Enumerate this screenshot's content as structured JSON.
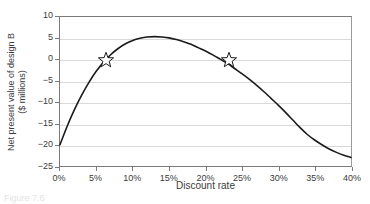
{
  "figure": {
    "caption_partial": "Figure 7.6"
  },
  "chart_data": {
    "type": "line",
    "title": "",
    "subtitle": "",
    "xlabel": "Discount rate",
    "ylabel": "Net present value of design B ($ millions)",
    "ylabel_line1": "Net present value of design B",
    "ylabel_line2": "($ millions)",
    "xlim": [
      0,
      40
    ],
    "ylim": [
      -25,
      10
    ],
    "xtick_labels": [
      "0%",
      "5%",
      "10%",
      "15%",
      "20%",
      "25%",
      "30%",
      "35%",
      "40%"
    ],
    "xtick_values": [
      0,
      5,
      10,
      15,
      20,
      25,
      30,
      35,
      40
    ],
    "ytick_labels": [
      "10",
      "5",
      "0",
      "-5",
      "-10",
      "-15",
      "-20",
      "-25"
    ],
    "ytick_values": [
      10,
      5,
      0,
      -5,
      -10,
      -15,
      -20,
      -25
    ],
    "grid": "horizontal",
    "legend": "none",
    "series": [
      {
        "name": "Net present value of design B",
        "color": "#1a1a1a",
        "x": [
          0,
          1,
          2,
          3,
          4,
          5,
          6,
          7,
          8,
          9,
          10,
          11,
          12,
          13,
          14,
          15,
          16,
          17,
          18,
          19,
          20,
          21,
          22,
          23,
          24,
          25,
          26,
          27,
          28,
          29,
          30,
          31,
          32,
          33,
          34,
          35,
          36,
          37,
          38,
          39,
          40
        ],
        "y": [
          -20.0,
          -15.6,
          -11.7,
          -8.3,
          -5.3,
          -2.7,
          -0.6,
          1.2,
          2.6,
          3.7,
          4.5,
          5.0,
          5.3,
          5.4,
          5.3,
          5.1,
          4.7,
          4.2,
          3.6,
          2.8,
          2.0,
          1.1,
          0.1,
          -0.9,
          -2.1,
          -3.3,
          -4.6,
          -6.0,
          -7.5,
          -9.1,
          -10.7,
          -12.4,
          -14.2,
          -16.0,
          -17.6,
          -18.9,
          -20.0,
          -21.0,
          -21.8,
          -22.5,
          -23.0
        ]
      }
    ],
    "markers": [
      {
        "name": "irr-lower-crossing",
        "shape": "star",
        "x": 6.3,
        "y": 0,
        "fill": "#ffffff",
        "stroke": "#1a1a1a"
      },
      {
        "name": "irr-upper-crossing",
        "shape": "star",
        "x": 23.1,
        "y": 0,
        "fill": "#ffffff",
        "stroke": "#1a1a1a"
      }
    ]
  }
}
